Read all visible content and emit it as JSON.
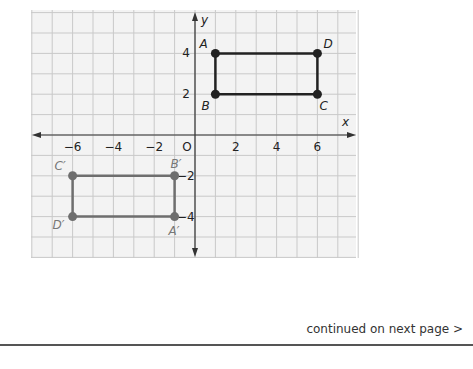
{
  "chart_data": {
    "type": "scatter",
    "title": "",
    "xlabel": "x",
    "ylabel": "y",
    "grid": true,
    "xlim": [
      -8,
      8
    ],
    "ylim": [
      -6,
      6
    ],
    "x_ticks": [
      "−6",
      "−4",
      "−2",
      "O",
      "2",
      "4",
      "6"
    ],
    "y_ticks": [
      "4",
      "2",
      "−2",
      "−4"
    ],
    "series": [
      {
        "name": "ABCD",
        "color": "#222222",
        "points": [
          {
            "label": "A",
            "x": 1,
            "y": 4
          },
          {
            "label": "D",
            "x": 6,
            "y": 4
          },
          {
            "label": "C",
            "x": 6,
            "y": 2
          },
          {
            "label": "B",
            "x": 1,
            "y": 2
          }
        ]
      },
      {
        "name": "A'B'C'D'",
        "color": "#6e6e6e",
        "points": [
          {
            "label": "B′",
            "x": -1,
            "y": -2
          },
          {
            "label": "C′",
            "x": -6,
            "y": -2
          },
          {
            "label": "D′",
            "x": -6,
            "y": -4
          },
          {
            "label": "A′",
            "x": -1,
            "y": -4
          }
        ]
      }
    ]
  },
  "footer": {
    "continued_text": "continued on next page >"
  }
}
